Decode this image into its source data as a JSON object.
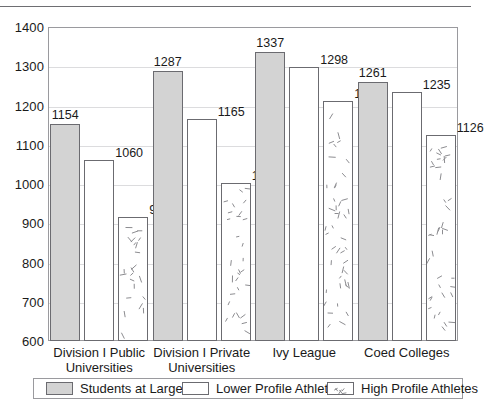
{
  "chart_data": {
    "type": "bar",
    "title": "",
    "xlabel": "",
    "ylabel": "",
    "ylim": [
      600,
      1400
    ],
    "ytick_step": 100,
    "yticks": [
      "1400",
      "1300",
      "1200",
      "1100",
      "1000",
      "900",
      "800",
      "700",
      "600"
    ],
    "grid": true,
    "legend_position": "bottom",
    "categories": [
      "Division I Public Universities",
      "Division I Private Universities",
      "Ivy League",
      "Coed Colleges"
    ],
    "series": [
      {
        "name": "Students at Large",
        "fill": "solid-gray",
        "color": "#d3d3d3",
        "values": [
          1154,
          1287,
          1337,
          1261
        ]
      },
      {
        "name": "Lower Profile Athletes",
        "fill": "white",
        "color": "#ffffff",
        "values": [
          1060,
          1165,
          1298,
          1235
        ]
      },
      {
        "name": "High Profile Athletes",
        "fill": "speckled",
        "color": "#ffffff",
        "values": [
          917,
          1003,
          1212,
          1126
        ]
      }
    ],
    "data_labels": [
      [
        "1154",
        "1060",
        "917"
      ],
      [
        "1287",
        "1165",
        "1003"
      ],
      [
        "1337",
        "1298",
        "1212"
      ],
      [
        "1261",
        "1235",
        "1126"
      ]
    ]
  },
  "axis": {
    "y_labels": [
      "1400",
      "1300",
      "1200",
      "1100",
      "1000",
      "900",
      "800",
      "700",
      "600"
    ],
    "x_labels": [
      {
        "line1": "Division I Public",
        "line2": "Universities"
      },
      {
        "line1": "Division I Private",
        "line2": "Universities"
      },
      {
        "line1": "Ivy League",
        "line2": ""
      },
      {
        "line1": "Coed Colleges",
        "line2": ""
      }
    ]
  },
  "legend": {
    "items": [
      {
        "label": "Students at Large",
        "swatch": "solid-gray-swatch"
      },
      {
        "label": "Lower Profile Athletes",
        "swatch": "white-swatch"
      },
      {
        "label": "High Profile Athletes",
        "swatch": "speckled-swatch"
      }
    ]
  }
}
